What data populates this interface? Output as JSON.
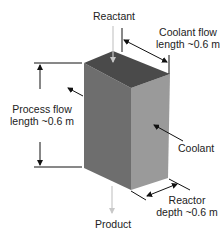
{
  "labels": {
    "reactant": "Reactant",
    "coolant_flow_1": "Coolant flow",
    "coolant_flow_2": "length ~0.6 m",
    "process_flow_1": "Process flow",
    "process_flow_2": "length ~0.6 m",
    "coolant": "Coolant",
    "reactor_depth_1": "Reactor",
    "reactor_depth_2": "depth ~0.6 m",
    "product": "Product"
  },
  "colors": {
    "top_face": "#4a4a4a",
    "left_face": "#6e6e6e",
    "right_face": "#9a9a9a",
    "line": "#111111",
    "flow_arrow": "#c8c8c8"
  }
}
